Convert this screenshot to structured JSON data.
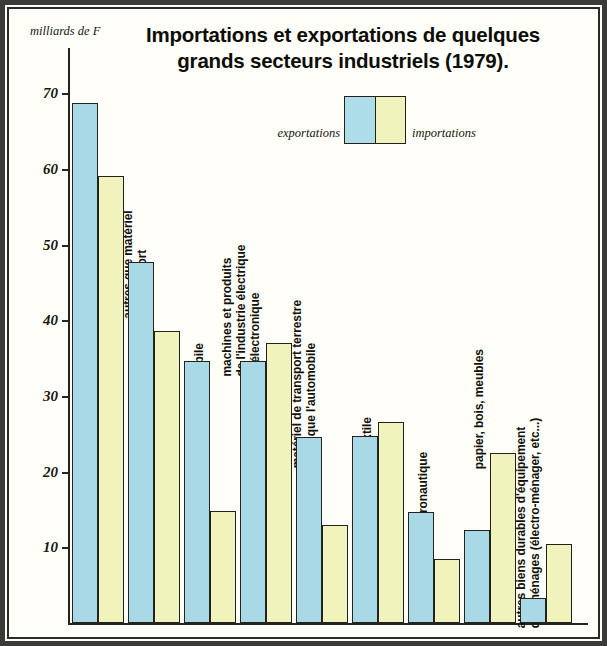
{
  "figure": {
    "title": "Importations et exportations de quelques grands secteurs industriels (1979).",
    "title_line1": "Importations et exportations de quelques",
    "title_line2": "grands secteurs industriels (1979).",
    "axis_unit": "milliards de F",
    "legend": {
      "export_label": "exportations",
      "import_label": "importations",
      "export_color": "#a9d9e6",
      "import_color": "#f0f4bc"
    }
  },
  "chart_data": {
    "type": "bar",
    "title": "Importations et exportations de quelques grands secteurs industriels (1979).",
    "xlabel": "",
    "ylabel": "milliards de F",
    "ylim": [
      0,
      74
    ],
    "yticks": [
      10,
      20,
      30,
      40,
      50,
      60,
      70
    ],
    "ytick_labels": [
      "10",
      "20",
      "30",
      "40",
      "50",
      "60",
      "70"
    ],
    "grid": false,
    "legend_position": "top-center",
    "categories": [
      "chimie",
      "machines et produits de l'industrie mécanique autres que matériel de transport",
      "automobile",
      "machines et produits de l'industrie électrique et électronique",
      "matériel de transport terrestre autre que l'automobile",
      "textile",
      "aéronautique",
      "papier, bois, meubles",
      "autres biens durables d'équipement des ménages (électro-ménager, etc...)"
    ],
    "category_lines": [
      [
        "chimie"
      ],
      [
        "machines et produits",
        "de l'industrie mécanique",
        "autres que matériel",
        "de transport"
      ],
      [
        "automobile"
      ],
      [
        "machines et produits",
        "de l'industrie électrique",
        "et électronique"
      ],
      [
        "matériel de transport terrestre",
        "autre que l'automobile"
      ],
      [
        "textile"
      ],
      [
        "aéronautique"
      ],
      [
        "papier, bois, meubles"
      ],
      [
        "autres biens durables d'équipement",
        "des ménages (électro-ménager, etc...)"
      ]
    ],
    "series": [
      {
        "name": "exportations",
        "color": "#a9d9e6",
        "values": [
          68.7,
          47.7,
          34.6,
          34.6,
          24.6,
          24.7,
          14.7,
          12.3,
          3.3
        ]
      },
      {
        "name": "importations",
        "color": "#f0f4bc",
        "values": [
          59.1,
          38.6,
          14.8,
          37.0,
          12.9,
          26.6,
          8.5,
          22.5,
          10.5
        ]
      }
    ]
  },
  "layout": {
    "y_zero_px": 623,
    "px_per_unit": 7.567,
    "bar_width": 26,
    "groups": [
      {
        "x": 72,
        "label_x": 94,
        "label_y": 195,
        "lines": 1
      },
      {
        "x": 128,
        "label_x": 150,
        "label_y": 262,
        "lines": 4
      },
      {
        "x": 184,
        "label_x": 206,
        "label_y": 392,
        "lines": 1
      },
      {
        "x": 240,
        "label_x": 262,
        "label_y": 334,
        "lines": 3
      },
      {
        "x": 296,
        "label_x": 318,
        "label_y": 440,
        "lines": 2
      },
      {
        "x": 352,
        "label_x": 374,
        "label_y": 437,
        "lines": 1
      },
      {
        "x": 408,
        "label_x": 430,
        "label_y": 512,
        "lines": 1
      },
      {
        "x": 464,
        "label_x": 486,
        "label_y": 455,
        "lines": 1
      },
      {
        "x": 520,
        "label_x": 542,
        "label_y": 600,
        "lines": 2
      }
    ]
  }
}
